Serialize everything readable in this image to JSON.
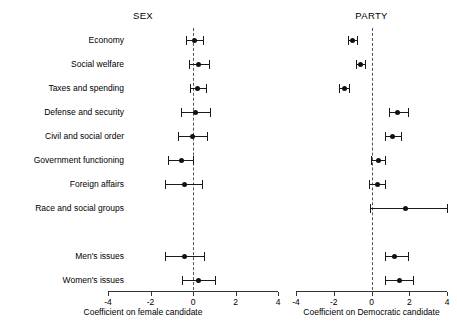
{
  "chart_data": {
    "type": "scatter",
    "title": "",
    "subtitle": "",
    "layout": "two side-by-side coefficient (dot-and-whisker) panels sharing category rows",
    "grid": false,
    "legend": null,
    "categories": [
      "Economy",
      "Social welfare",
      "Taxes and spending",
      "Defense and security",
      "Civil and social order",
      "Government functioning",
      "Foreign affairs",
      "Race and social groups",
      "",
      "Men's issues",
      "Women's issues"
    ],
    "panels": [
      {
        "name": "SEX",
        "title": "SEX",
        "xlabel": "Coefficient on female candidate",
        "xlim": [
          -4,
          4
        ],
        "xticks": [
          -4,
          -2,
          0,
          2,
          4
        ],
        "xticklabels": [
          "-4",
          "-2",
          "0",
          "2",
          "4"
        ],
        "reference_line": 0,
        "points": [
          {
            "category": "Economy",
            "estimate": 0.05,
            "ci_low": -0.35,
            "ci_high": 0.45
          },
          {
            "category": "Social welfare",
            "estimate": 0.28,
            "ci_low": -0.2,
            "ci_high": 0.75
          },
          {
            "category": "Taxes and spending",
            "estimate": 0.22,
            "ci_low": -0.15,
            "ci_high": 0.62
          },
          {
            "category": "Defense and security",
            "estimate": 0.12,
            "ci_low": -0.55,
            "ci_high": 0.82
          },
          {
            "category": "Civil and social order",
            "estimate": -0.02,
            "ci_low": -0.7,
            "ci_high": 0.65
          },
          {
            "category": "Government functioning",
            "estimate": -0.55,
            "ci_low": -1.2,
            "ci_high": 0.02
          },
          {
            "category": "Foreign affairs",
            "estimate": -0.4,
            "ci_low": -1.3,
            "ci_high": 0.42
          },
          {
            "category": "Race and social groups",
            "estimate": null,
            "ci_low": null,
            "ci_high": null
          },
          {
            "category": "",
            "estimate": null,
            "ci_low": null,
            "ci_high": null
          },
          {
            "category": "Men's issues",
            "estimate": -0.38,
            "ci_low": -1.3,
            "ci_high": 0.5
          },
          {
            "category": "Women's issues",
            "estimate": 0.25,
            "ci_low": -0.52,
            "ci_high": 1.05
          }
        ]
      },
      {
        "name": "PARTY",
        "title": "PARTY",
        "xlabel": "Coefficient on Democratic candidate",
        "xlim": [
          -4,
          4
        ],
        "xticks": [
          -4,
          -2,
          0,
          2,
          4
        ],
        "xticklabels": [
          "-4",
          "-2",
          "0",
          "2",
          "4"
        ],
        "reference_line": 0,
        "points": [
          {
            "category": "Economy",
            "estimate": -1.0,
            "ci_low": -1.22,
            "ci_high": -0.78
          },
          {
            "category": "Social welfare",
            "estimate": -0.58,
            "ci_low": -0.82,
            "ci_high": -0.34
          },
          {
            "category": "Taxes and spending",
            "estimate": -1.45,
            "ci_low": -1.7,
            "ci_high": -1.2
          },
          {
            "category": "Defense and security",
            "estimate": 1.38,
            "ci_low": 0.92,
            "ci_high": 1.95
          },
          {
            "category": "Civil and social order",
            "estimate": 1.12,
            "ci_low": 0.7,
            "ci_high": 1.55
          },
          {
            "category": "Government functioning",
            "estimate": 0.35,
            "ci_low": -0.02,
            "ci_high": 0.72
          },
          {
            "category": "Foreign affairs",
            "estimate": 0.3,
            "ci_low": -0.12,
            "ci_high": 0.7
          },
          {
            "category": "Race and social groups",
            "estimate": 1.8,
            "ci_low": -0.1,
            "ci_high": 4.0
          },
          {
            "category": "",
            "estimate": null,
            "ci_low": null,
            "ci_high": null
          },
          {
            "category": "Men's issues",
            "estimate": 1.22,
            "ci_low": 0.7,
            "ci_high": 1.95
          },
          {
            "category": "Women's issues",
            "estimate": 1.48,
            "ci_low": 0.72,
            "ci_high": 2.18
          }
        ]
      }
    ]
  }
}
